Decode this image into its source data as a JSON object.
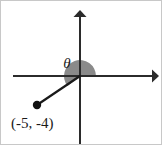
{
  "figure": {
    "type": "coordinate-plane-angle-diagram",
    "background_color": "#ffffff",
    "border_color": "#c8c8c8",
    "width": 162,
    "height": 145
  },
  "axes": {
    "color": "#2b2b2b",
    "origin": {
      "x": 79,
      "y": 75
    },
    "x_axis": {
      "name": "x-axis",
      "start_x": 12,
      "end_x": 158,
      "y": 75,
      "arrow_right": true,
      "arrow_left": false
    },
    "y_axis": {
      "name": "y-axis",
      "x": 79,
      "start_y": 10,
      "end_y": 145,
      "arrow_up": true,
      "arrow_down": false
    }
  },
  "angle": {
    "label": "θ",
    "label_x": 66,
    "label_y": 67,
    "sector_color": "#8a8a8a",
    "sector_radius": 16,
    "start_degrees": 0,
    "sweep_degrees": 219
  },
  "terminal_ray": {
    "name": "terminal-side",
    "from_x": 79,
    "from_y": 75,
    "to_x": 36,
    "to_y": 104,
    "color": "#1a1a1a"
  },
  "point": {
    "label": "(-5, -4)",
    "marker_x": 36,
    "marker_y": 104,
    "marker_radius": 4.2,
    "label_x": 10,
    "label_y": 127,
    "coordinates": {
      "x": -5,
      "y": -4
    }
  },
  "chart_data": {
    "type": "scatter",
    "title": "",
    "xlabel": "",
    "ylabel": "",
    "points": [
      {
        "label": "(-5, -4)",
        "x": -5,
        "y": -4
      }
    ],
    "annotations": [
      {
        "text": "θ",
        "meaning": "standard-position-angle-from-positive-x-axis"
      }
    ],
    "grid": false,
    "legend": "none"
  }
}
